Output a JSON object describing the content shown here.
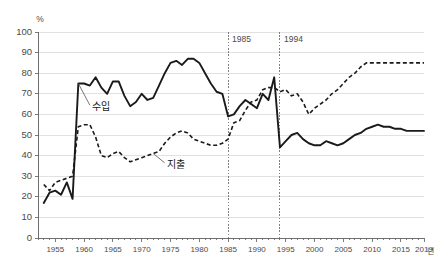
{
  "chart_data": {
    "type": "line",
    "title": "",
    "xlabel": "년",
    "ylabel": "%",
    "yunit": "%",
    "xunit": "년",
    "xlim": [
      1952,
      2019
    ],
    "ylim": [
      0,
      100
    ],
    "grid": true,
    "legend_position": "inline-annotations",
    "y_ticks": [
      "0",
      "10",
      "20",
      "30",
      "40",
      "50",
      "60",
      "70",
      "80",
      "90",
      "100"
    ],
    "y_tick_values": [
      0,
      10,
      20,
      30,
      40,
      50,
      60,
      70,
      80,
      90,
      100
    ],
    "x_ticks": [
      "1955",
      "1960",
      "1965",
      "1970",
      "1975",
      "1980",
      "1985",
      "1990",
      "1995",
      "2000",
      "2005",
      "2010",
      "2015",
      "2019"
    ],
    "x_tick_values": [
      1955,
      1960,
      1965,
      1970,
      1975,
      1980,
      1985,
      1990,
      1995,
      2000,
      2005,
      2010,
      2015,
      2019
    ],
    "annotations": [
      {
        "label": "1985",
        "x": 1985,
        "type": "vertical-dotted-line"
      },
      {
        "label": "1994",
        "x": 1994,
        "type": "vertical-dotted-line"
      }
    ],
    "series": [
      {
        "name": "수입",
        "style": "solid",
        "label_x": 1961,
        "label_y": 63,
        "x": [
          1953,
          1954,
          1955,
          1956,
          1957,
          1958,
          1959,
          1960,
          1961,
          1962,
          1963,
          1964,
          1965,
          1966,
          1967,
          1968,
          1969,
          1970,
          1971,
          1972,
          1973,
          1974,
          1975,
          1976,
          1977,
          1978,
          1979,
          1980,
          1981,
          1982,
          1983,
          1984,
          1985,
          1986,
          1987,
          1988,
          1989,
          1990,
          1991,
          1992,
          1993,
          1994,
          1995,
          1996,
          1997,
          1998,
          1999,
          2000,
          2001,
          2002,
          2003,
          2004,
          2005,
          2006,
          2007,
          2008,
          2009,
          2010,
          2011,
          2012,
          2013,
          2014,
          2015,
          2016,
          2017,
          2018,
          2019
        ],
        "values": [
          17,
          22,
          23,
          21,
          27,
          19,
          75,
          75,
          74,
          78,
          73,
          70,
          76,
          76,
          69,
          64,
          66,
          70,
          67,
          68,
          74,
          80,
          85,
          86,
          84,
          87,
          87,
          85,
          80,
          75,
          71,
          70,
          59,
          60,
          64,
          67,
          65,
          63,
          70,
          67,
          78,
          44,
          47,
          50,
          51,
          48,
          46,
          45,
          45,
          47,
          46,
          45,
          46,
          48,
          50,
          51,
          53,
          54,
          55,
          54,
          54,
          53,
          53,
          52,
          52,
          52,
          52
        ]
      },
      {
        "name": "지출",
        "style": "dashed",
        "label_x": 1974,
        "label_y": 35,
        "x": [
          1953,
          1954,
          1955,
          1956,
          1957,
          1958,
          1959,
          1960,
          1961,
          1962,
          1963,
          1964,
          1965,
          1966,
          1967,
          1968,
          1969,
          1970,
          1971,
          1972,
          1973,
          1974,
          1975,
          1976,
          1977,
          1978,
          1979,
          1980,
          1981,
          1982,
          1983,
          1984,
          1985,
          1986,
          1987,
          1988,
          1989,
          1990,
          1991,
          1992,
          1993,
          1994,
          1995,
          1996,
          1997,
          1998,
          1999,
          2000,
          2001,
          2002,
          2003,
          2004,
          2005,
          2006,
          2007,
          2008,
          2009,
          2010,
          2011,
          2012,
          2013,
          2014,
          2015,
          2016,
          2017,
          2018,
          2019
        ],
        "values": [
          26,
          23,
          27,
          28,
          29,
          30,
          54,
          55,
          55,
          49,
          40,
          39,
          41,
          42,
          39,
          37,
          38,
          39,
          40,
          41,
          42,
          46,
          49,
          51,
          52,
          51,
          48,
          47,
          46,
          45,
          45,
          46,
          48,
          56,
          57,
          62,
          66,
          67,
          72,
          73,
          73,
          71,
          72,
          69,
          70,
          66,
          60,
          63,
          65,
          67,
          70,
          72,
          75,
          78,
          80,
          83,
          85,
          85,
          85,
          85,
          85,
          85,
          85,
          85,
          85,
          85,
          85
        ]
      }
    ]
  }
}
